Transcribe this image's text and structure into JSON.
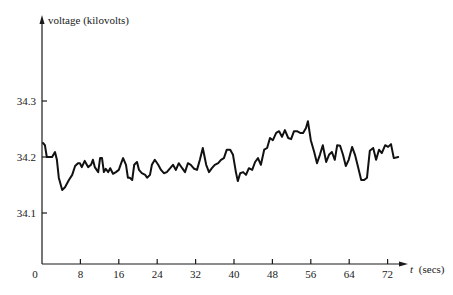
{
  "chart_data": {
    "type": "line",
    "title": "",
    "xlabel": "t (secs)",
    "ylabel": "voltage (kilovolts)",
    "xlim": [
      0,
      76
    ],
    "ylim": [
      34.0,
      34.45
    ],
    "grid": false,
    "legend": null,
    "x_ticks": [
      0,
      8,
      16,
      24,
      32,
      40,
      48,
      56,
      64,
      72
    ],
    "x_tick_labels": [
      "0",
      "8",
      "16",
      "24",
      "32",
      "40",
      "48",
      "56",
      "64",
      "72"
    ],
    "y_ticks": [
      34.1,
      34.2,
      34.3
    ],
    "y_tick_labels": [
      "34.1",
      "34.2",
      "34.3"
    ],
    "series": [
      {
        "name": "voltage",
        "x": [
          0.2,
          0.6,
          1.0,
          2.1,
          2.7,
          3.1,
          3.5,
          4.2,
          4.8,
          5.6,
          6.3,
          6.9,
          7.5,
          7.9,
          8.3,
          8.9,
          9.6,
          10.2,
          10.6,
          11.0,
          11.7,
          12.1,
          12.5,
          12.9,
          13.3,
          13.8,
          14.2,
          14.8,
          15.4,
          16.0,
          16.5,
          16.9,
          17.5,
          17.9,
          18.3,
          18.8,
          19.2,
          19.8,
          20.2,
          20.8,
          21.5,
          21.9,
          22.5,
          22.9,
          23.5,
          24.2,
          24.8,
          25.4,
          26.0,
          26.7,
          27.3,
          27.9,
          28.5,
          29.2,
          29.8,
          30.4,
          31.0,
          31.7,
          32.3,
          32.9,
          33.5,
          34.2,
          34.8,
          35.4,
          36.0,
          36.7,
          37.3,
          37.9,
          38.5,
          39.2,
          39.8,
          40.4,
          40.8,
          41.3,
          41.9,
          42.5,
          43.1,
          43.8,
          44.4,
          45.0,
          45.6,
          46.3,
          46.9,
          47.5,
          48.1,
          48.8,
          49.4,
          50.0,
          50.6,
          51.3,
          51.9,
          52.5,
          53.1,
          53.8,
          54.4,
          55.0,
          55.4,
          56.0,
          56.7,
          57.3,
          57.9,
          58.5,
          59.2,
          59.8,
          60.4,
          61.0,
          61.5,
          62.1,
          62.7,
          63.3,
          63.9,
          64.6,
          65.2,
          65.8,
          66.5,
          67.1,
          67.7,
          68.3,
          69.0,
          69.6,
          70.2,
          70.8,
          71.5,
          72.1,
          72.7,
          73.3,
          74.2
        ],
        "y": [
          34.225,
          34.221,
          34.2,
          34.2,
          34.209,
          34.195,
          34.163,
          34.141,
          34.146,
          34.159,
          34.168,
          34.184,
          34.189,
          34.189,
          34.182,
          34.193,
          34.182,
          34.186,
          34.195,
          34.182,
          34.173,
          34.198,
          34.198,
          34.173,
          34.179,
          34.173,
          34.18,
          34.17,
          34.173,
          34.177,
          34.189,
          34.198,
          34.186,
          34.163,
          34.163,
          34.159,
          34.186,
          34.191,
          34.177,
          34.171,
          34.168,
          34.163,
          34.168,
          34.186,
          34.195,
          34.186,
          34.177,
          34.171,
          34.173,
          34.18,
          34.186,
          34.177,
          34.189,
          34.18,
          34.173,
          34.189,
          34.186,
          34.179,
          34.177,
          34.195,
          34.216,
          34.186,
          34.173,
          34.18,
          34.186,
          34.189,
          34.195,
          34.198,
          34.213,
          34.213,
          34.204,
          34.173,
          34.157,
          34.171,
          34.173,
          34.168,
          34.18,
          34.177,
          34.191,
          34.198,
          34.186,
          34.213,
          34.216,
          34.234,
          34.23,
          34.243,
          34.246,
          34.236,
          34.248,
          34.234,
          34.232,
          34.246,
          34.246,
          34.243,
          34.243,
          34.252,
          34.264,
          34.23,
          34.209,
          34.189,
          34.204,
          34.221,
          34.191,
          34.204,
          34.209,
          34.195,
          34.221,
          34.22,
          34.204,
          34.184,
          34.195,
          34.218,
          34.204,
          34.184,
          34.159,
          34.159,
          34.163,
          34.211,
          34.216,
          34.195,
          34.213,
          34.207,
          34.221,
          34.218,
          34.223,
          34.198,
          34.2
        ]
      }
    ]
  },
  "axes": {
    "y_title": "voltage (kilovolts)",
    "x_title_italic": "t",
    "x_title_unit": "(secs)"
  }
}
